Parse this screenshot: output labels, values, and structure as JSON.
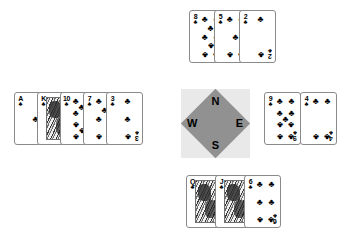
{
  "board": {
    "suit_symbol": "♣",
    "background_color": "#ffffff",
    "card_border_color": "#8a8a8a"
  },
  "compass": {
    "name": "compass-rose",
    "square_color": "#e9e9e9",
    "diamond_color": "#919191",
    "north": "N",
    "west": "W",
    "east": "E",
    "south": "S"
  },
  "hands": {
    "north": {
      "label": "North",
      "cards": [
        {
          "rank": "8",
          "suit": "♣",
          "type": "number",
          "pips": 8
        },
        {
          "rank": "5",
          "suit": "♣",
          "type": "number",
          "pips": 5
        },
        {
          "rank": "2",
          "suit": "♣",
          "type": "number",
          "pips": 2
        }
      ]
    },
    "west": {
      "label": "West",
      "cards": [
        {
          "rank": "A",
          "suit": "♣",
          "type": "number",
          "pips": 1
        },
        {
          "rank": "K",
          "suit": "♣",
          "type": "face",
          "pips": 0
        },
        {
          "rank": "10",
          "suit": "♣",
          "type": "number",
          "pips": 10
        },
        {
          "rank": "7",
          "suit": "♣",
          "type": "number",
          "pips": 7
        },
        {
          "rank": "3",
          "suit": "♣",
          "type": "number",
          "pips": 3
        }
      ]
    },
    "east": {
      "label": "East",
      "cards": [
        {
          "rank": "9",
          "suit": "♣",
          "type": "number",
          "pips": 9
        },
        {
          "rank": "4",
          "suit": "♣",
          "type": "number",
          "pips": 4
        }
      ]
    },
    "south": {
      "label": "South",
      "cards": [
        {
          "rank": "Q",
          "suit": "♣",
          "type": "face",
          "pips": 0
        },
        {
          "rank": "J",
          "suit": "♣",
          "type": "face",
          "pips": 0
        },
        {
          "rank": "6",
          "suit": "♣",
          "type": "number",
          "pips": 6
        }
      ]
    }
  }
}
